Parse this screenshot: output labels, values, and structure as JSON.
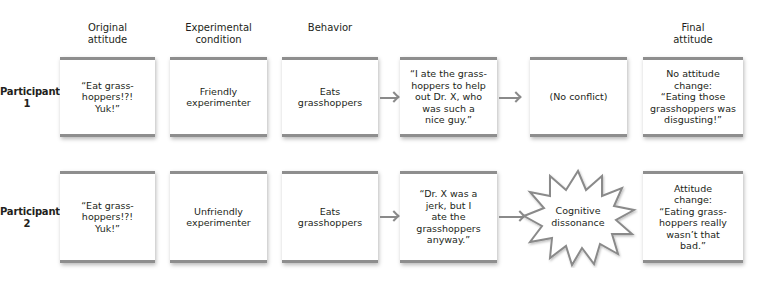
{
  "headers": {
    "original_attitude": "Original\nattitude",
    "experimental_condition": "Experimental\ncondition",
    "behavior": "Behavior",
    "final_attitude": "Final\nattitude"
  },
  "rows": [
    {
      "participant": "Participant\n1",
      "original_attitude": "“Eat grass-\nhoppers!?!\nYuk!”",
      "condition": "Friendly\nexperimenter",
      "behavior": "Eats\ngrasshoppers",
      "justification": "“I ate the grass-\nhoppers to help\nout Dr. X, who\nwas such a\nnice guy.”",
      "conflict": "(No conflict)",
      "final_attitude": "No attitude\nchange:\n“Eating those\ngrasshoppers was\ndisgusting!”"
    },
    {
      "participant": "Participant\n2",
      "original_attitude": "“Eat grass-\nhoppers!?!\nYuk!”",
      "condition": "Unfriendly\nexperimenter",
      "behavior": "Eats\ngrasshoppers",
      "justification": "“Dr. X was a\njerk, but I\nate the\ngrasshoppers\nanyway.”",
      "conflict": "Cognitive\ndissonance",
      "final_attitude": "Attitude\nchange:\n“Eating grass-\nhoppers really\nwasn’t that\nbad.”"
    }
  ],
  "colors": {
    "bar": "#8e8e8e",
    "arrow": "#8a8a8a",
    "text": "#231f20"
  },
  "icons": {
    "arrow": "right-arrow-icon",
    "burst": "starburst-icon"
  }
}
